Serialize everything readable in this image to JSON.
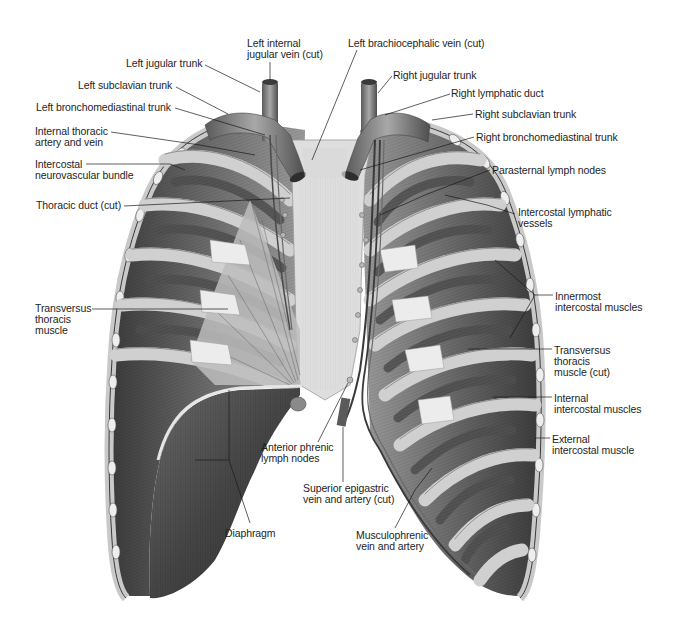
{
  "figure": {
    "colors": {
      "background": "#ffffff",
      "text": "#1e1e1e",
      "leader_line": "#1a1a1a",
      "rib_light": "#d6d6d6",
      "rib_mid": "#a9a9a9",
      "muscle_dark": "#5e5e5e",
      "muscle_darker": "#3f3f3f",
      "sternum": "#e2e2e2",
      "vessel": "#7a7a7a",
      "diaphragm": "#4d4d4d"
    }
  },
  "labels": [
    {
      "id": "left-internal-jugular-vein",
      "text": "Left internal\njugular vein (cut)",
      "x": 247,
      "y": 38,
      "line": [
        [
          270,
          62
        ],
        [
          270,
          80
        ]
      ]
    },
    {
      "id": "left-brachiocephalic-vein",
      "text": "Left brachiocephalic vein (cut)",
      "x": 348,
      "y": 38,
      "line": [
        [
          357,
          50
        ],
        [
          312,
          160
        ]
      ]
    },
    {
      "id": "left-jugular-trunk",
      "text": "Left jugular trunk",
      "x": 126,
      "y": 58,
      "line": [
        [
          205,
          65
        ],
        [
          260,
          92
        ]
      ]
    },
    {
      "id": "right-jugular-trunk",
      "text": "Right jugular trunk",
      "x": 393,
      "y": 70,
      "line": [
        [
          392,
          76
        ],
        [
          378,
          93
        ]
      ]
    },
    {
      "id": "left-subclavian-trunk",
      "text": "Left subclavian trunk",
      "x": 78,
      "y": 80,
      "line": [
        [
          176,
          87
        ],
        [
          228,
          114
        ]
      ]
    },
    {
      "id": "right-lymphatic-duct",
      "text": "Right lymphatic duct",
      "x": 451,
      "y": 88,
      "line": [
        [
          450,
          94
        ],
        [
          385,
          115
        ]
      ]
    },
    {
      "id": "left-bronchomediastinal-trunk",
      "text": "Left bronchomediastinal trunk",
      "x": 36,
      "y": 102,
      "line": [
        [
          175,
          108
        ],
        [
          265,
          135
        ]
      ]
    },
    {
      "id": "right-subclavian-trunk",
      "text": "Right subclavian trunk",
      "x": 475,
      "y": 109,
      "line": [
        [
          473,
          114
        ],
        [
          432,
          120
        ]
      ]
    },
    {
      "id": "internal-thoracic-artery-and-vein",
      "text": "Internal thoracic\nartery and vein",
      "x": 35,
      "y": 126,
      "line": [
        [
          111,
          132
        ],
        [
          200,
          145
        ],
        [
          255,
          155
        ]
      ]
    },
    {
      "id": "right-bronchomediastinal-trunk",
      "text": "Right bronchomediastinal trunk",
      "x": 476,
      "y": 132,
      "line": [
        [
          474,
          137
        ],
        [
          360,
          170
        ]
      ]
    },
    {
      "id": "intercostal-neurovascular-bundle",
      "text": "Intercostal\nneurovascular bundle",
      "x": 35,
      "y": 159,
      "line": [
        [
          86,
          164
        ],
        [
          170,
          164
        ],
        [
          185,
          170
        ]
      ]
    },
    {
      "id": "parasternal-lymph-nodes",
      "text": "Parasternal lymph nodes",
      "x": 492,
      "y": 165,
      "line": [
        [
          490,
          170
        ],
        [
          425,
          195
        ],
        [
          380,
          215
        ]
      ]
    },
    {
      "id": "thoracic-duct",
      "text": "Thoracic duct (cut)",
      "x": 36,
      "y": 200,
      "line": [
        [
          124,
          206
        ],
        [
          290,
          198
        ]
      ]
    },
    {
      "id": "intercostal-lymphatic-vessels",
      "text": "Intercostal lymphatic\nvessels",
      "x": 518,
      "y": 207,
      "line": [
        [
          515,
          214
        ],
        [
          487,
          205
        ],
        [
          445,
          195
        ]
      ]
    },
    {
      "id": "innermost-intercostal-muscles",
      "text": "Innermost\nintercostal muscles",
      "x": 555,
      "y": 291,
      "line": [
        [
          553,
          295
        ],
        [
          535,
          295
        ],
        [
          495,
          260
        ]
      ],
      "line2": [
        [
          535,
          295
        ],
        [
          510,
          338
        ]
      ]
    },
    {
      "id": "transversus-thoracis-muscle",
      "text": "Transversus\nthoracis\nmuscle",
      "x": 35,
      "y": 303,
      "line": [
        [
          92,
          309
        ],
        [
          228,
          309
        ]
      ]
    },
    {
      "id": "transversus-thoracis-muscle-cut",
      "text": "Transversus\nthoracis\nmuscle (cut)",
      "x": 554,
      "y": 345,
      "line": [
        [
          552,
          349
        ],
        [
          468,
          349
        ]
      ]
    },
    {
      "id": "internal-intercostal-muscles",
      "text": "Internal\nintercostal muscles",
      "x": 554,
      "y": 393,
      "line": [
        [
          552,
          397
        ],
        [
          493,
          397
        ]
      ]
    },
    {
      "id": "anterior-phrenic-lymph-nodes",
      "text": "Anterior phrenic\nlymph nodes",
      "x": 261,
      "y": 442,
      "line": [
        [
          318,
          442
        ],
        [
          348,
          383
        ]
      ]
    },
    {
      "id": "external-intercostal-muscle",
      "text": "External\nintercostal muscle",
      "x": 552,
      "y": 434,
      "line": [
        [
          550,
          438
        ],
        [
          535,
          438
        ]
      ]
    },
    {
      "id": "superior-epigastric-vein-and-artery",
      "text": "Superior epigastric\nvein and artery (cut)",
      "x": 303,
      "y": 483,
      "line": [
        [
          343,
          482
        ],
        [
          343,
          427
        ]
      ]
    },
    {
      "id": "diaphragm",
      "text": "Diaphragm",
      "x": 225,
      "y": 528,
      "line": [
        [
          250,
          523
        ],
        [
          229,
          460
        ],
        [
          229,
          390
        ]
      ],
      "line2": [
        [
          229,
          460
        ],
        [
          195,
          460
        ]
      ]
    },
    {
      "id": "musculophrenic-vein-and-artery",
      "text": "Musculophrenic\nvein and artery",
      "x": 356,
      "y": 530,
      "line": [
        [
          395,
          528
        ],
        [
          415,
          490
        ],
        [
          432,
          468
        ]
      ]
    }
  ]
}
